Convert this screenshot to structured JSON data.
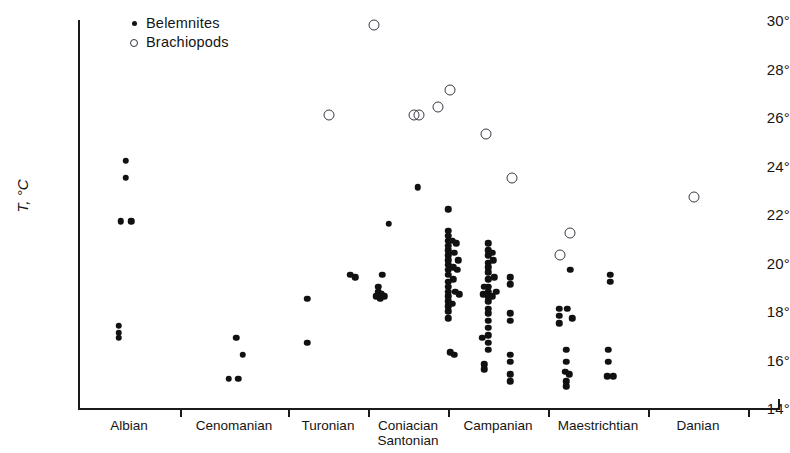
{
  "chart_data": {
    "type": "scatter",
    "title": "",
    "xlabel": "",
    "ylabel": "T, °C",
    "ylim": [
      14,
      30
    ],
    "yticks": [
      14,
      16,
      18,
      20,
      22,
      24,
      26,
      28,
      30
    ],
    "ytick_labels": [
      "14°",
      "16°",
      "18°",
      "20°",
      "22°",
      "24°",
      "26°",
      "28°",
      "30°"
    ],
    "grid": false,
    "legend_position": "top-left",
    "categories": [
      "Albian",
      "Cenomanian",
      "Turonian",
      "Coniacian Santonian",
      "Campanian",
      "Maestrichtian",
      "Danian"
    ],
    "category_labels": [
      {
        "line1": "Albian",
        "line2": ""
      },
      {
        "line1": "Cenomanian",
        "line2": ""
      },
      {
        "line1": "Turonian",
        "line2": ""
      },
      {
        "line1": "Coniacian",
        "line2": "Santonian"
      },
      {
        "line1": "Campanian",
        "line2": ""
      },
      {
        "line1": "Maestrichtian",
        "line2": ""
      },
      {
        "line1": "Danian",
        "line2": ""
      }
    ],
    "legend": [
      {
        "key": "belemnites",
        "label": "Belemnites",
        "marker": "filled-circle",
        "color": "#111111"
      },
      {
        "key": "brachiopods",
        "label": "Brachiopods",
        "marker": "open-circle",
        "color": "#333340"
      }
    ],
    "series": [
      {
        "name": "Belemnites",
        "marker": "filled-circle",
        "points": [
          {
            "stage": "Albian",
            "xf": 0.47,
            "t": 24.2
          },
          {
            "stage": "Albian",
            "xf": 0.47,
            "t": 23.5
          },
          {
            "stage": "Albian",
            "xf": 0.42,
            "t": 21.7
          },
          {
            "stage": "Albian",
            "xf": 0.52,
            "t": 21.7
          },
          {
            "stage": "Albian",
            "xf": 0.4,
            "t": 17.4
          },
          {
            "stage": "Albian",
            "xf": 0.4,
            "t": 17.1
          },
          {
            "stage": "Albian",
            "xf": 0.4,
            "t": 16.9
          },
          {
            "stage": "Cenomanian",
            "xf": 0.52,
            "t": 16.9
          },
          {
            "stage": "Cenomanian",
            "xf": 0.58,
            "t": 16.2
          },
          {
            "stage": "Cenomanian",
            "xf": 0.45,
            "t": 15.2
          },
          {
            "stage": "Cenomanian",
            "xf": 0.54,
            "t": 15.2
          },
          {
            "stage": "Turonian",
            "xf": 0.24,
            "t": 18.5
          },
          {
            "stage": "Turonian",
            "xf": 0.24,
            "t": 16.7
          },
          {
            "stage": "Turonian",
            "xf": 0.78,
            "t": 19.5
          },
          {
            "stage": "Turonian",
            "xf": 0.84,
            "t": 19.4
          },
          {
            "stage": "Coniacian Santonian",
            "xf": 0.26,
            "t": 21.6
          },
          {
            "stage": "Coniacian Santonian",
            "xf": 0.62,
            "t": 23.1
          },
          {
            "stage": "Coniacian Santonian",
            "xf": 0.18,
            "t": 19.5
          },
          {
            "stage": "Coniacian Santonian",
            "xf": 0.13,
            "t": 19.0
          },
          {
            "stage": "Coniacian Santonian",
            "xf": 0.13,
            "t": 18.8
          },
          {
            "stage": "Coniacian Santonian",
            "xf": 0.17,
            "t": 18.7
          },
          {
            "stage": "Coniacian Santonian",
            "xf": 0.1,
            "t": 18.6
          },
          {
            "stage": "Coniacian Santonian",
            "xf": 0.21,
            "t": 18.6
          },
          {
            "stage": "Coniacian Santonian",
            "xf": 0.15,
            "t": 18.5
          },
          {
            "stage": "Campanian",
            "xf": 0.0,
            "t": 22.2
          },
          {
            "stage": "Campanian",
            "xf": 0.0,
            "t": 21.3
          },
          {
            "stage": "Campanian",
            "xf": 0.0,
            "t": 21.1
          },
          {
            "stage": "Campanian",
            "xf": 0.0,
            "t": 20.9
          },
          {
            "stage": "Campanian",
            "xf": 0.0,
            "t": 20.7
          },
          {
            "stage": "Campanian",
            "xf": 0.0,
            "t": 20.5
          },
          {
            "stage": "Campanian",
            "xf": 0.0,
            "t": 20.3
          },
          {
            "stage": "Campanian",
            "xf": 0.0,
            "t": 20.1
          },
          {
            "stage": "Campanian",
            "xf": 0.0,
            "t": 19.9
          },
          {
            "stage": "Campanian",
            "xf": 0.0,
            "t": 19.7
          },
          {
            "stage": "Campanian",
            "xf": 0.0,
            "t": 19.5
          },
          {
            "stage": "Campanian",
            "xf": 0.0,
            "t": 19.2
          },
          {
            "stage": "Campanian",
            "xf": 0.0,
            "t": 19.0
          },
          {
            "stage": "Campanian",
            "xf": 0.0,
            "t": 18.8
          },
          {
            "stage": "Campanian",
            "xf": 0.0,
            "t": 18.6
          },
          {
            "stage": "Campanian",
            "xf": 0.0,
            "t": 18.4
          },
          {
            "stage": "Campanian",
            "xf": 0.0,
            "t": 18.2
          },
          {
            "stage": "Campanian",
            "xf": 0.0,
            "t": 18.0
          },
          {
            "stage": "Campanian",
            "xf": 0.0,
            "t": 17.7
          },
          {
            "stage": "Campanian",
            "xf": 0.04,
            "t": 20.9
          },
          {
            "stage": "Campanian",
            "xf": 0.08,
            "t": 20.8
          },
          {
            "stage": "Campanian",
            "xf": 0.06,
            "t": 20.4
          },
          {
            "stage": "Campanian",
            "xf": 0.1,
            "t": 20.1
          },
          {
            "stage": "Campanian",
            "xf": 0.05,
            "t": 19.8
          },
          {
            "stage": "Campanian",
            "xf": 0.09,
            "t": 19.7
          },
          {
            "stage": "Campanian",
            "xf": 0.05,
            "t": 19.3
          },
          {
            "stage": "Campanian",
            "xf": 0.07,
            "t": 18.8
          },
          {
            "stage": "Campanian",
            "xf": 0.11,
            "t": 18.7
          },
          {
            "stage": "Campanian",
            "xf": 0.04,
            "t": 18.3
          },
          {
            "stage": "Campanian",
            "xf": 0.02,
            "t": 16.3
          },
          {
            "stage": "Campanian",
            "xf": 0.06,
            "t": 16.2
          },
          {
            "stage": "Campanian",
            "xf": 0.4,
            "t": 20.8
          },
          {
            "stage": "Campanian",
            "xf": 0.4,
            "t": 20.5
          },
          {
            "stage": "Campanian",
            "xf": 0.4,
            "t": 20.3
          },
          {
            "stage": "Campanian",
            "xf": 0.4,
            "t": 20.0
          },
          {
            "stage": "Campanian",
            "xf": 0.4,
            "t": 19.8
          },
          {
            "stage": "Campanian",
            "xf": 0.4,
            "t": 19.6
          },
          {
            "stage": "Campanian",
            "xf": 0.4,
            "t": 19.3
          },
          {
            "stage": "Campanian",
            "xf": 0.4,
            "t": 19.0
          },
          {
            "stage": "Campanian",
            "xf": 0.4,
            "t": 18.8
          },
          {
            "stage": "Campanian",
            "xf": 0.4,
            "t": 18.6
          },
          {
            "stage": "Campanian",
            "xf": 0.4,
            "t": 18.4
          },
          {
            "stage": "Campanian",
            "xf": 0.4,
            "t": 18.1
          },
          {
            "stage": "Campanian",
            "xf": 0.4,
            "t": 17.9
          },
          {
            "stage": "Campanian",
            "xf": 0.4,
            "t": 17.6
          },
          {
            "stage": "Campanian",
            "xf": 0.4,
            "t": 17.3
          },
          {
            "stage": "Campanian",
            "xf": 0.4,
            "t": 17.0
          },
          {
            "stage": "Campanian",
            "xf": 0.4,
            "t": 16.7
          },
          {
            "stage": "Campanian",
            "xf": 0.4,
            "t": 16.4
          },
          {
            "stage": "Campanian",
            "xf": 0.44,
            "t": 20.4
          },
          {
            "stage": "Campanian",
            "xf": 0.45,
            "t": 20.1
          },
          {
            "stage": "Campanian",
            "xf": 0.46,
            "t": 19.4
          },
          {
            "stage": "Campanian",
            "xf": 0.48,
            "t": 18.8
          },
          {
            "stage": "Campanian",
            "xf": 0.44,
            "t": 18.6
          },
          {
            "stage": "Campanian",
            "xf": 0.36,
            "t": 19.0
          },
          {
            "stage": "Campanian",
            "xf": 0.35,
            "t": 18.7
          },
          {
            "stage": "Campanian",
            "xf": 0.34,
            "t": 16.9
          },
          {
            "stage": "Campanian",
            "xf": 0.36,
            "t": 15.8
          },
          {
            "stage": "Campanian",
            "xf": 0.36,
            "t": 15.6
          },
          {
            "stage": "Campanian",
            "xf": 0.62,
            "t": 19.4
          },
          {
            "stage": "Campanian",
            "xf": 0.62,
            "t": 19.1
          },
          {
            "stage": "Campanian",
            "xf": 0.62,
            "t": 17.9
          },
          {
            "stage": "Campanian",
            "xf": 0.62,
            "t": 17.6
          },
          {
            "stage": "Campanian",
            "xf": 0.62,
            "t": 16.2
          },
          {
            "stage": "Campanian",
            "xf": 0.62,
            "t": 15.9
          },
          {
            "stage": "Campanian",
            "xf": 0.62,
            "t": 15.4
          },
          {
            "stage": "Campanian",
            "xf": 0.62,
            "t": 15.1
          },
          {
            "stage": "Maestrichtian",
            "xf": 0.22,
            "t": 19.7
          },
          {
            "stage": "Maestrichtian",
            "xf": 0.11,
            "t": 18.1
          },
          {
            "stage": "Maestrichtian",
            "xf": 0.19,
            "t": 18.1
          },
          {
            "stage": "Maestrichtian",
            "xf": 0.11,
            "t": 17.8
          },
          {
            "stage": "Maestrichtian",
            "xf": 0.24,
            "t": 17.7
          },
          {
            "stage": "Maestrichtian",
            "xf": 0.11,
            "t": 17.5
          },
          {
            "stage": "Maestrichtian",
            "xf": 0.18,
            "t": 16.4
          },
          {
            "stage": "Maestrichtian",
            "xf": 0.18,
            "t": 15.9
          },
          {
            "stage": "Maestrichtian",
            "xf": 0.17,
            "t": 15.5
          },
          {
            "stage": "Maestrichtian",
            "xf": 0.21,
            "t": 15.4
          },
          {
            "stage": "Maestrichtian",
            "xf": 0.18,
            "t": 15.1
          },
          {
            "stage": "Maestrichtian",
            "xf": 0.18,
            "t": 14.9
          },
          {
            "stage": "Maestrichtian",
            "xf": 0.62,
            "t": 19.5
          },
          {
            "stage": "Maestrichtian",
            "xf": 0.62,
            "t": 19.2
          },
          {
            "stage": "Maestrichtian",
            "xf": 0.6,
            "t": 16.4
          },
          {
            "stage": "Maestrichtian",
            "xf": 0.6,
            "t": 15.9
          },
          {
            "stage": "Maestrichtian",
            "xf": 0.59,
            "t": 15.3
          },
          {
            "stage": "Maestrichtian",
            "xf": 0.65,
            "t": 15.3
          }
        ]
      },
      {
        "name": "Brachiopods",
        "marker": "open-circle",
        "points": [
          {
            "stage": "Turonian",
            "xf": 0.51,
            "t": 26.1
          },
          {
            "stage": "Coniacian Santonian",
            "xf": 0.08,
            "t": 29.8
          },
          {
            "stage": "Coniacian Santonian",
            "xf": 0.58,
            "t": 26.1
          },
          {
            "stage": "Coniacian Santonian",
            "xf": 0.64,
            "t": 26.1
          },
          {
            "stage": "Coniacian Santonian",
            "xf": 0.88,
            "t": 26.4
          },
          {
            "stage": "Campanian",
            "xf": 0.02,
            "t": 27.1
          },
          {
            "stage": "Campanian",
            "xf": 0.38,
            "t": 25.3
          },
          {
            "stage": "Campanian",
            "xf": 0.64,
            "t": 23.5
          },
          {
            "stage": "Maestrichtian",
            "xf": 0.22,
            "t": 21.2
          },
          {
            "stage": "Maestrichtian",
            "xf": 0.12,
            "t": 20.3
          },
          {
            "stage": "Danian",
            "xf": 0.46,
            "t": 22.7
          }
        ]
      }
    ]
  },
  "axes_geometry": {
    "plot_left": 78,
    "plot_right": 778,
    "plot_top": 20,
    "plot_bottom": 408,
    "t_top": 30,
    "t_bottom": 14,
    "stage_boundaries": [
      78,
      180,
      288,
      368,
      448,
      548,
      648,
      748,
      778
    ]
  }
}
